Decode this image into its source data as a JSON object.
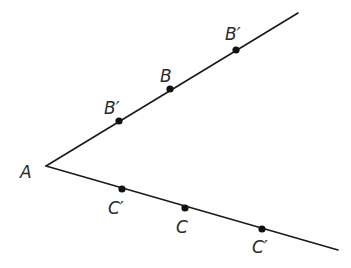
{
  "diagram": {
    "title": "",
    "vertex": {
      "name": "A",
      "x": 46,
      "y": 166,
      "label": "A",
      "label_x": 20,
      "label_y": 178
    },
    "rays": [
      {
        "id": "upper-ray",
        "x1": 46,
        "y1": 166,
        "x2": 298,
        "y2": 13
      },
      {
        "id": "lower-ray",
        "x1": 46,
        "y1": 166,
        "x2": 338,
        "y2": 250
      }
    ],
    "points": [
      {
        "id": "b-prime-near",
        "ray": "upper",
        "label": "B′",
        "x": 119,
        "y": 121,
        "label_x": 104,
        "label_y": 114
      },
      {
        "id": "b",
        "ray": "upper",
        "label": "B",
        "x": 170,
        "y": 89,
        "label_x": 160,
        "label_y": 82
      },
      {
        "id": "b-prime-far",
        "ray": "upper",
        "label": "B′",
        "x": 236,
        "y": 50,
        "label_x": 225,
        "label_y": 40
      },
      {
        "id": "c-prime-near",
        "ray": "lower",
        "label": "C′",
        "x": 122,
        "y": 189,
        "label_x": 108,
        "label_y": 214
      },
      {
        "id": "c",
        "ray": "lower",
        "label": "C",
        "x": 185,
        "y": 208,
        "label_x": 176,
        "label_y": 233
      },
      {
        "id": "c-prime-far",
        "ray": "lower",
        "label": "C′",
        "x": 262,
        "y": 229,
        "label_x": 252,
        "label_y": 253
      }
    ],
    "colors": {
      "line": "#1a1a1a",
      "point": "#111111",
      "label": "#2a2a2a",
      "background": "#ffffff"
    }
  }
}
